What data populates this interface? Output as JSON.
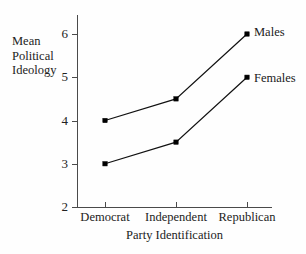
{
  "chart_data": {
    "type": "line",
    "title": "",
    "xlabel": "Party Identification",
    "ylabel": "Mean Political Ideology",
    "ylabel_lines": [
      "Mean",
      "Political",
      "Ideology"
    ],
    "categories": [
      "Democrat",
      "Independent",
      "Republican"
    ],
    "yticks": [
      2,
      3,
      4,
      5,
      6
    ],
    "ytick_labels": [
      "2",
      "3",
      "4",
      "5",
      "6"
    ],
    "ylim": [
      2,
      6
    ],
    "grid": false,
    "legend_position": "right-inline-labels",
    "series": [
      {
        "name": "Males",
        "values": [
          4,
          4.5,
          6
        ],
        "color": "#111111",
        "marker": "square"
      },
      {
        "name": "Females",
        "values": [
          3,
          3.5,
          5
        ],
        "color": "#111111",
        "marker": "square"
      }
    ],
    "annotations": [
      {
        "text": "Males",
        "attached_to": "Males",
        "at_category": "Republican"
      },
      {
        "text": "Females",
        "attached_to": "Females",
        "at_category": "Republican"
      }
    ]
  },
  "figure": {
    "background_color": "#fefefe",
    "axis_color": "#4a4a4a",
    "text_color": "#1a1a1a"
  }
}
